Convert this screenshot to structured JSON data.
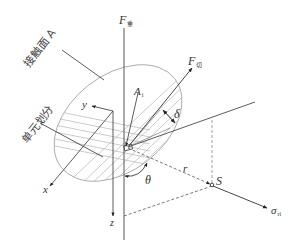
{
  "diagram": {
    "title": "",
    "labels": {
      "force_normal": "F",
      "force_normal_sub": "重",
      "force_shear": "F",
      "force_shear_sub": "切",
      "contact_surface": "接触面 A",
      "element_division": "单元划分",
      "element_area": "A",
      "element_area_sub": "i",
      "angle_delta": "δ",
      "angle_theta": "θ",
      "radius": "r",
      "point_S": "S",
      "stress": "σ",
      "stress_sub": "ri",
      "axis_x": "x",
      "axis_y": "y",
      "axis_z": "z"
    },
    "colors": {
      "line": "#333333",
      "ellipse": "#9a9a9a",
      "hatch": "#b0b0b0",
      "dashed": "#555555"
    }
  }
}
